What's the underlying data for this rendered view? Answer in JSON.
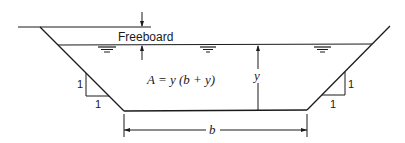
{
  "diagram": {
    "labels": {
      "freeboard": "Freeboard",
      "area_formula": "A = y (b + y)",
      "depth": "y",
      "bottom_width": "b",
      "left_slope_rise": "1",
      "left_slope_run": "1",
      "right_slope_rise": "1",
      "right_slope_run": "1"
    },
    "colors": {
      "line": "#1a1a1a",
      "background": "#ffffff"
    },
    "elements": [
      "ground-line",
      "left-bank",
      "right-bank",
      "channel-bottom",
      "water-surface",
      "freeboard-dimension",
      "depth-dimension",
      "bottom-width-dimension",
      "slope-triangle-left",
      "slope-triangle-right",
      "water-surface-symbols"
    ]
  }
}
